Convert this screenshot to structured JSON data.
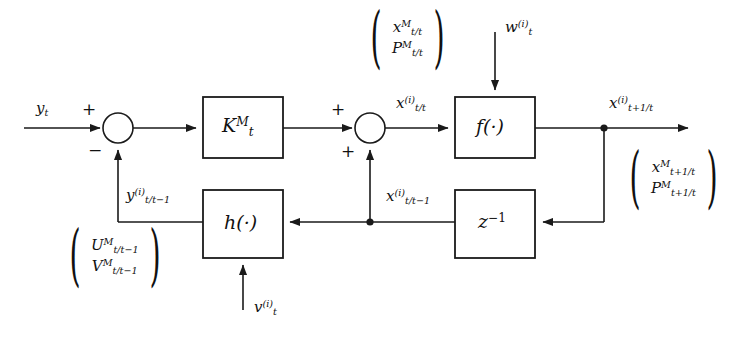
{
  "figure": {
    "type": "block-diagram",
    "background_color": "#ffffff",
    "line_color": "#1a1a1a"
  },
  "blocks": [
    {
      "id": "gain",
      "label_html": "K<sup>M</sup><sub>t</sub>",
      "name": "kalman-gain-block"
    },
    {
      "id": "state_fn",
      "label_html": "f(·)",
      "name": "state-transition-block"
    },
    {
      "id": "meas_fn",
      "label_html": "h(·)",
      "name": "measurement-function-block"
    },
    {
      "id": "delay",
      "label_html": "z<sup class=\"upr\">−1</sup>",
      "name": "unit-delay-block"
    }
  ],
  "junctions": [
    {
      "id": "sum1",
      "name": "summing-junction-innovation",
      "signs": [
        "+",
        "−"
      ]
    },
    {
      "id": "sum2",
      "name": "summing-junction-state-update",
      "signs": [
        "+",
        "+"
      ]
    }
  ],
  "signals": {
    "input_measurement": "y<sub>t</sub>",
    "predicted_state_filtered": "x<sup>(i)</sup><sub>t/t</sub>",
    "predicted_state_next": "x<sup>(i)</sup><sub>t+1/t</sub>",
    "delayed_state": "x<sup>(i)</sup><sub>t/t−1</sub>",
    "predicted_output": "y<sup>(i)</sup><sub>t/t−1</sub>",
    "process_noise": "w<sup>(i)</sup><sub>t</sub>",
    "measurement_noise": "v<sup>(i)</sup><sub>t</sub>"
  },
  "sign_labels": {
    "sum1_plus": "+",
    "sum1_minus": "−",
    "sum2_plus_top": "+",
    "sum2_plus_bottom": "+"
  },
  "vectors": [
    {
      "id": "vec_filtered",
      "name": "filtered-moments-vector",
      "position": "top-center",
      "rows": [
        "x<sup>M</sup><sub>t/t</sub>",
        "P<sup>M</sup><sub>t/t</sub>"
      ]
    },
    {
      "id": "vec_predicted",
      "name": "predicted-moments-vector",
      "position": "right",
      "rows": [
        "x<sup>M</sup><sub>t+1/t</sub>",
        "P<sup>M</sup><sub>t+1/t</sub>"
      ]
    },
    {
      "id": "vec_uv",
      "name": "innovation-moments-vector",
      "position": "bottom-left",
      "rows": [
        "U<sup>M</sup><sub>t/t−1</sub>",
        "V<sup>M</sup><sub>t/t−1</sub>"
      ]
    }
  ]
}
